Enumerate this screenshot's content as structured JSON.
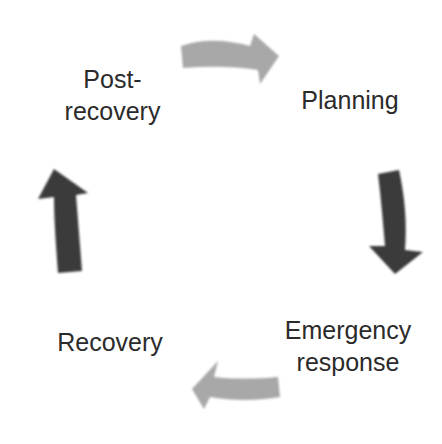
{
  "diagram": {
    "type": "cycle",
    "stages": [
      {
        "id": "planning",
        "label": "Planning"
      },
      {
        "id": "emergency-response",
        "label_line1": "Emergency",
        "label_line2": "response"
      },
      {
        "id": "recovery",
        "label": "Recovery"
      },
      {
        "id": "post-recovery",
        "label_line1": "Post-",
        "label_line2": "recovery"
      }
    ],
    "arrows": [
      {
        "from": "post-recovery",
        "to": "planning",
        "direction": "right",
        "color": "#a8a8a8"
      },
      {
        "from": "planning",
        "to": "emergency-response",
        "direction": "down",
        "color": "#3a3a3a"
      },
      {
        "from": "emergency-response",
        "to": "recovery",
        "direction": "left",
        "color": "#a8a8a8"
      },
      {
        "from": "recovery",
        "to": "post-recovery",
        "direction": "up",
        "color": "#3a3a3a"
      }
    ]
  }
}
